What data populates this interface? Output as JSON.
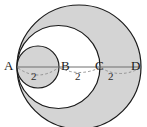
{
  "figure": {
    "background_color": "#ffffff",
    "stroke_color": "#1a1a1a",
    "shaded_fill": "#d4d4d4",
    "unshaded_fill": "#ffffff",
    "dashed_arc_color": "#8a8a8a",
    "baseline_color": "#6e6e6e"
  },
  "points": [
    {
      "id": "A",
      "label": "A",
      "x": 17
    },
    {
      "id": "B",
      "label": "B",
      "x": 59
    },
    {
      "id": "C",
      "label": "C",
      "x": 100
    },
    {
      "id": "D",
      "label": "D",
      "x": 141
    }
  ],
  "baseline": {
    "y": 67,
    "x_start": 17,
    "x_end": 141
  },
  "circles": [
    {
      "id": "large-circle",
      "name": "circle-AD",
      "diameter_endpoints": [
        "A",
        "D"
      ],
      "cx": 79,
      "cy": 67,
      "r": 62,
      "fill": "#d4d4d4",
      "shaded": true
    },
    {
      "id": "medium-circle",
      "name": "circle-AC",
      "diameter_endpoints": [
        "A",
        "C"
      ],
      "cx": 58.5,
      "cy": 67,
      "r": 41.5,
      "fill": "#ffffff",
      "shaded": false
    },
    {
      "id": "small-circle",
      "name": "circle-AB",
      "diameter_endpoints": [
        "A",
        "B"
      ],
      "cx": 38,
      "cy": 67,
      "r": 21,
      "fill": "#d4d4d4",
      "shaded": true
    }
  ],
  "measurements": [
    {
      "id": "ab",
      "label": "2",
      "from": "A",
      "to": "B",
      "x_mid": 38,
      "arc_depth": 11
    },
    {
      "id": "bc",
      "label": "2",
      "from": "B",
      "to": "C",
      "x_mid": 79.5,
      "arc_depth": 6
    },
    {
      "id": "cd",
      "label": "2",
      "from": "C",
      "to": "D",
      "x_mid": 120.5,
      "arc_depth": 8
    }
  ]
}
